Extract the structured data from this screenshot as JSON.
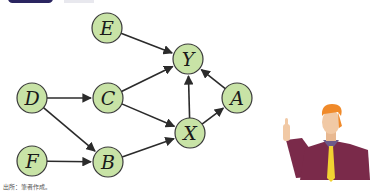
{
  "header": {
    "bar_color": "#2a2560"
  },
  "diagram": {
    "node_fill": "#c8e3a6",
    "node_stroke": "#3a3a3a",
    "edge_color": "#2b2b2b",
    "radius": 15,
    "nodes": [
      {
        "id": "E",
        "label": "E",
        "x": 107,
        "y": 28
      },
      {
        "id": "Y",
        "label": "Y",
        "x": 188,
        "y": 59
      },
      {
        "id": "A",
        "label": "A",
        "x": 237,
        "y": 98
      },
      {
        "id": "D",
        "label": "D",
        "x": 32,
        "y": 98
      },
      {
        "id": "C",
        "label": "C",
        "x": 108,
        "y": 98
      },
      {
        "id": "X",
        "label": "X",
        "x": 190,
        "y": 133
      },
      {
        "id": "F",
        "label": "F",
        "x": 32,
        "y": 161
      },
      {
        "id": "B",
        "label": "B",
        "x": 108,
        "y": 162
      }
    ],
    "edges": [
      {
        "from": "E",
        "to": "Y"
      },
      {
        "from": "C",
        "to": "Y"
      },
      {
        "from": "X",
        "to": "Y"
      },
      {
        "from": "A",
        "to": "Y"
      },
      {
        "from": "D",
        "to": "C"
      },
      {
        "from": "D",
        "to": "B"
      },
      {
        "from": "C",
        "to": "X"
      },
      {
        "from": "F",
        "to": "B"
      },
      {
        "from": "B",
        "to": "X"
      },
      {
        "from": "X",
        "to": "A"
      }
    ]
  },
  "footer": {
    "source_note": "出所：筆者作成。"
  },
  "illustration": {
    "name": "pointing-businessman",
    "jacket_color": "#7a2a4a",
    "tie_color": "#f2d232",
    "hair_color": "#f08a2a",
    "skin_color": "#f1c9a5"
  }
}
